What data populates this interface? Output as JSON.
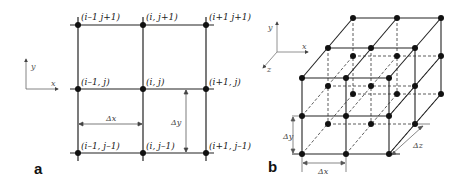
{
  "figure": {
    "panel_a": {
      "label": "a",
      "axes": {
        "x": "x",
        "y": "y"
      },
      "nodes": [
        {
          "label": "(i–1 j+1)",
          "col": 0,
          "row": 0
        },
        {
          "label": "(i, j+1)",
          "col": 1,
          "row": 0
        },
        {
          "label": "(i+1 j+1)",
          "col": 2,
          "row": 0
        },
        {
          "label": "(i–1, j)",
          "col": 0,
          "row": 1
        },
        {
          "label": "(i, j)",
          "col": 1,
          "row": 1
        },
        {
          "label": "(i+1, j)",
          "col": 2,
          "row": 1
        },
        {
          "label": "(i–1, j–1)",
          "col": 0,
          "row": 2
        },
        {
          "label": "(i, j–1)",
          "col": 1,
          "row": 2
        },
        {
          "label": "(i+1, j–1)",
          "col": 2,
          "row": 2
        }
      ],
      "dimensions": {
        "dx": "Δx",
        "dy": "Δy"
      }
    },
    "panel_b": {
      "label": "b",
      "axes": {
        "x": "x",
        "y": "y",
        "z": "z"
      },
      "grid": "3×3×3 nodes",
      "dimensions": {
        "dx": "Δx",
        "dy": "Δy",
        "dz": "Δz"
      }
    }
  }
}
